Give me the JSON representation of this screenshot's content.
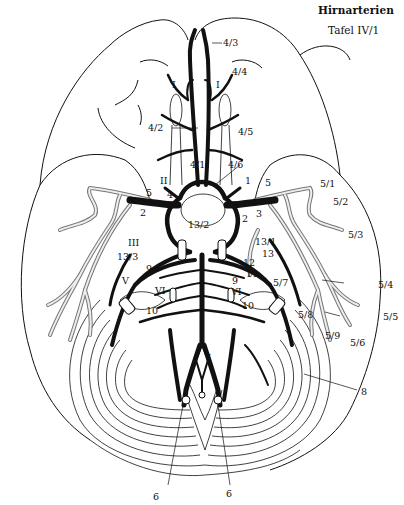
{
  "header": {
    "title": "Hirnarterien",
    "plate": "Tafel IV/1"
  },
  "colors": {
    "ink": "#111111",
    "paper": "#ffffff",
    "vessel_fill": "#e8e8e8"
  },
  "labels": {
    "l_4_3": "4/3",
    "l_4_4": "4/4",
    "l_I_left": "I",
    "l_I_right": "I",
    "l_4_2": "4/2",
    "l_4_5": "4/5",
    "l_4_1": "4/1",
    "l_4_6": "4/6",
    "l_II": "II",
    "l_1": "1",
    "l_5_left": "5",
    "l_5_center": "5",
    "l_5_right": "5",
    "l_4": "4",
    "l_2_left": "2",
    "l_2_right": "2",
    "l_3": "3",
    "l_13_2": "13/2",
    "l_5_1": "5/1",
    "l_5_2": "5/2",
    "l_5_3": "5/3",
    "l_III": "III",
    "l_13_3": "13/3",
    "l_13_1": "13/1",
    "l_13": "13",
    "l_12": "12",
    "l_11": "11",
    "l_9_left": "9",
    "l_9_right": "9",
    "l_V": "V",
    "l_VI_left": "VI",
    "l_VI_right": "VI",
    "l_5_7": "5/7",
    "l_5_4": "5/4",
    "l_10_left": "10",
    "l_10_right": "10",
    "l_5_8": "5/8",
    "l_5_5": "5/5",
    "l_5_9": "5/9",
    "l_5_6": "5/6",
    "l_7": "7",
    "l_8": "8",
    "l_6_left": "6",
    "l_6_right": "6"
  }
}
